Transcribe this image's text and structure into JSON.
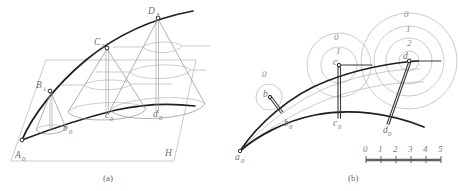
{
  "figure": {
    "background_color": "#ffffff",
    "stroke_dark": "#1f1f1f",
    "stroke_gray": "#a8a8a8",
    "label_color": "#6f6f6f",
    "panels": [
      {
        "id": "panel-a",
        "caption": "(a)",
        "description": "Perspective view of cones of increasing size standing on a reference plane along a curved trajectory",
        "plane_label": "H",
        "points": [
          {
            "name": "A0",
            "base": "A",
            "subscript": "0",
            "x": 22,
            "y": 140
          },
          {
            "name": "B1",
            "base": "B",
            "subscript": "1",
            "x": 48,
            "y": 90
          },
          {
            "name": "C2",
            "base": "C",
            "subscript": "2",
            "x": 104,
            "y": 47
          },
          {
            "name": "D3",
            "base": "D",
            "subscript": "3",
            "x": 160,
            "y": 17
          },
          {
            "name": "b0",
            "base": "b",
            "subscript": "0",
            "x": 68,
            "y": 128
          },
          {
            "name": "c0",
            "base": "c",
            "subscript": "0",
            "x": 110,
            "y": 114
          },
          {
            "name": "d0",
            "base": "d",
            "subscript": "0",
            "x": 158,
            "y": 114
          }
        ]
      },
      {
        "id": "panel-b",
        "caption": "(b)",
        "description": "Plan view with concentric circles of radii marked 0, 1, 2 around the projected apex points",
        "points": [
          {
            "name": "a0",
            "base": "a",
            "subscript": "0",
            "x": 240,
            "y": 151
          },
          {
            "name": "b1",
            "base": "b",
            "subscript": "1",
            "x": 268,
            "y": 95
          },
          {
            "name": "b0",
            "base": "b",
            "subscript": "0",
            "x": 289,
            "y": 121
          },
          {
            "name": "c2",
            "base": "c",
            "subscript": "2",
            "x": 338,
            "y": 62
          },
          {
            "name": "c0",
            "base": "c",
            "subscript": "0",
            "x": 338,
            "y": 117
          },
          {
            "name": "d3",
            "base": "d",
            "subscript": "3",
            "x": 409,
            "y": 59
          },
          {
            "name": "d0",
            "base": "d",
            "subscript": "0",
            "x": 389,
            "y": 123
          }
        ],
        "circle_groups": [
          {
            "center": "b1",
            "ring_labels": [
              "0"
            ]
          },
          {
            "center": "c2",
            "ring_labels": [
              "0",
              "1"
            ]
          },
          {
            "center": "d3",
            "ring_labels": [
              "0",
              "1",
              "2"
            ]
          }
        ],
        "scale": {
          "ticks": [
            "0",
            "1",
            "2",
            "3",
            "4",
            "5"
          ],
          "start_x": 366,
          "end_x": 441,
          "bar_y": 160
        }
      }
    ]
  }
}
